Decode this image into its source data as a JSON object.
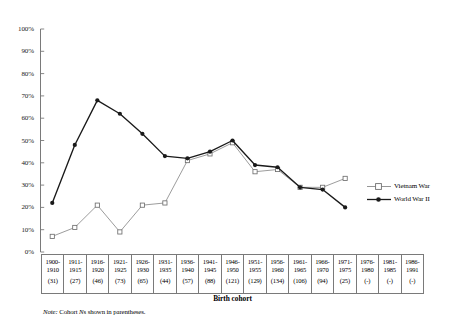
{
  "chart_data": {
    "type": "line",
    "title": "",
    "xlabel": "Birth cohort",
    "ylabel": "",
    "ylim": [
      0,
      100
    ],
    "ytick_labels": [
      "100%",
      "90%",
      "80%",
      "70%",
      "60%",
      "50%",
      "40%",
      "30%",
      "20%",
      "10%",
      "0%"
    ],
    "ytick_values": [
      100,
      90,
      80,
      70,
      60,
      50,
      40,
      30,
      20,
      10,
      0
    ],
    "grid": false,
    "legend_position": "right-middle",
    "categories": [
      "1900-1910",
      "1911-1915",
      "1916-1920",
      "1921-1925",
      "1926-1930",
      "1931-1935",
      "1936-1940",
      "1941-1945",
      "1946-1950",
      "1951-1955",
      "1956-1960",
      "1961-1965",
      "1966-1970",
      "1971-1975",
      "1976-1980",
      "1981-1985",
      "1986-1991"
    ],
    "category_lines": [
      {
        "l1": "1900-",
        "l2": "1910",
        "n": "(31)"
      },
      {
        "l1": "1911-",
        "l2": "1915",
        "n": "(27)"
      },
      {
        "l1": "1916-",
        "l2": "1920",
        "n": "(46)"
      },
      {
        "l1": "1921-",
        "l2": "1925",
        "n": "(73)"
      },
      {
        "l1": "1926-",
        "l2": "1930",
        "n": "(65)"
      },
      {
        "l1": "1931-",
        "l2": "1935",
        "n": "(44)"
      },
      {
        "l1": "1936-",
        "l2": "1940",
        "n": "(57)"
      },
      {
        "l1": "1941-",
        "l2": "1945",
        "n": "(88)"
      },
      {
        "l1": "1946-",
        "l2": "1950",
        "n": "(121)"
      },
      {
        "l1": "1951-",
        "l2": "1955",
        "n": "(129)"
      },
      {
        "l1": "1956-",
        "l2": "1960",
        "n": "(134)"
      },
      {
        "l1": "1961-",
        "l2": "1965",
        "n": "(106)"
      },
      {
        "l1": "1966-",
        "l2": "1970",
        "n": "(94)"
      },
      {
        "l1": "1971-",
        "l2": "1975",
        "n": "(25)"
      },
      {
        "l1": "1976-",
        "l2": "1980",
        "n": "(-)"
      },
      {
        "l1": "1981-",
        "l2": "1985",
        "n": "(-)"
      },
      {
        "l1": "1986-",
        "l2": "1991",
        "n": "(-)"
      }
    ],
    "series": [
      {
        "name": "Vietnam War",
        "marker": "open-square",
        "color": "#8a8a8a",
        "values": [
          7,
          11,
          21,
          9,
          21,
          22,
          41,
          44,
          49,
          36,
          37,
          29,
          29,
          33,
          null,
          null,
          null
        ]
      },
      {
        "name": "World War II",
        "marker": "filled-circle",
        "color": "#1a1a1a",
        "values": [
          22,
          48,
          68,
          62,
          53,
          43,
          42,
          45,
          50,
          39,
          38,
          29,
          28,
          20,
          null,
          null,
          null
        ]
      }
    ],
    "note_prefix": "Note:",
    "note_body": " Cohort ",
    "note_italic_n": "N",
    "note_suffix": "s shown in parentheses."
  },
  "legend": {
    "items": [
      {
        "label": "Vietnam War",
        "marker": "open-square",
        "color": "#8a8a8a"
      },
      {
        "label": "World War II",
        "marker": "filled-circle",
        "color": "#1a1a1a"
      }
    ]
  }
}
